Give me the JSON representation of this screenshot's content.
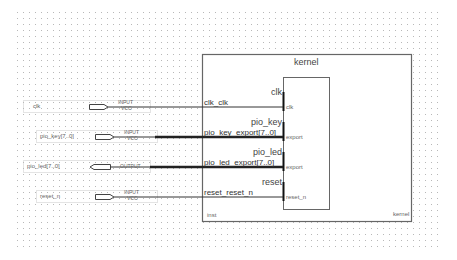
{
  "colors": {
    "background": "#ffffff",
    "grid_dot": "#b8b8b8",
    "wire": "#333333",
    "bus": "#222222",
    "block_border": "#666666",
    "pin_box": "#bbbbbb"
  },
  "grid": {
    "x0": 17,
    "y0": 12,
    "x1": 441,
    "y1": 247,
    "spacing": 6
  },
  "pins": [
    {
      "name": "clk",
      "direction": "input",
      "type_label": "INPUT",
      "default_label": "VCC",
      "bus": false
    },
    {
      "name": "pio_key[7..0]",
      "direction": "input",
      "type_label": "INPUT",
      "default_label": "VCC",
      "bus": true
    },
    {
      "name": "pio_led[7..0]",
      "direction": "output",
      "type_label": "OUTPUT",
      "default_label": "",
      "bus": true
    },
    {
      "name": "reset_n",
      "direction": "input",
      "type_label": "INPUT",
      "default_label": "VCC",
      "bus": false
    }
  ],
  "block": {
    "title": "kernel",
    "instance": "inst",
    "type_name": "kernel",
    "ports": [
      {
        "conduit": "clk_clk",
        "interface": "clk",
        "signal": "clk"
      },
      {
        "conduit": "pio_key_export[7..0]",
        "interface": "pio_key",
        "signal": "export"
      },
      {
        "conduit": "pio_led_export[7..0]",
        "interface": "pio_led",
        "signal": "export"
      },
      {
        "conduit": "reset_reset_n",
        "interface": "reset",
        "signal": "reset_n"
      }
    ]
  }
}
